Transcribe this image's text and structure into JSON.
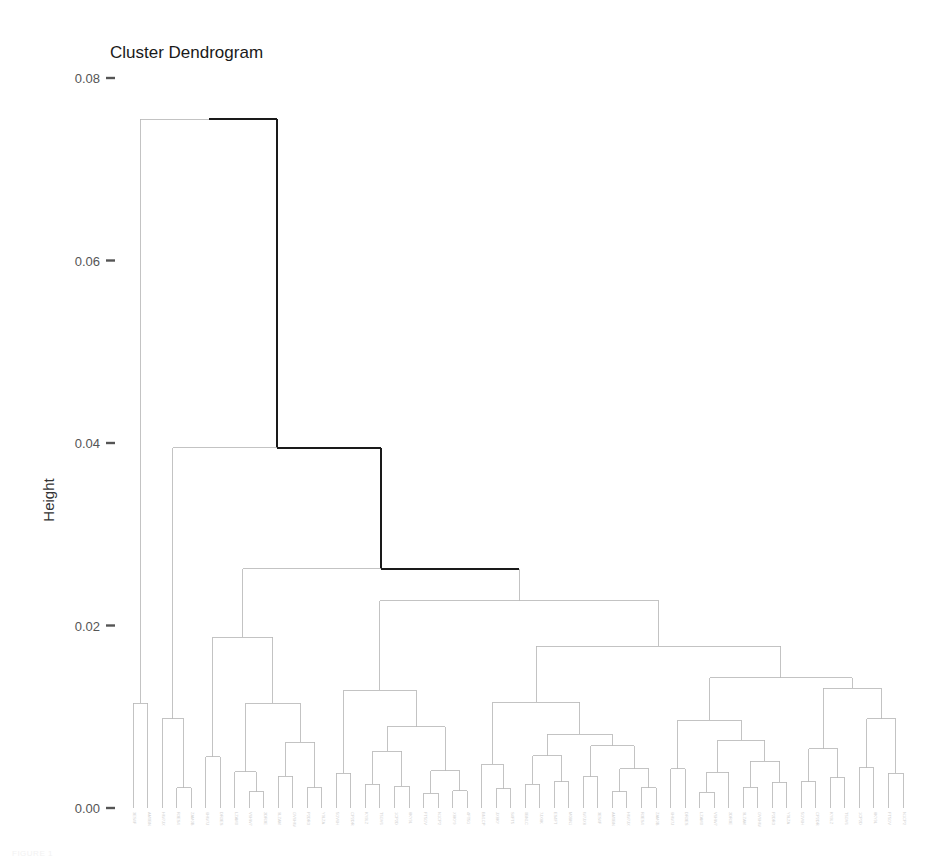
{
  "figure": {
    "title": "Cluster Dendrogram",
    "width": 930,
    "height": 867
  },
  "axis": {
    "y_title": "Height",
    "y_ticks": [
      "0.00",
      "0.02",
      "0.04",
      "0.06",
      "0.08"
    ],
    "y_tick_values": [
      0.0,
      0.02,
      0.04,
      0.06,
      0.08
    ],
    "x_title": "",
    "grid": false
  },
  "colors": {
    "background": "#ffffff",
    "branch_light": "#b9b9b9",
    "branch_highlight": "#1a1a1a",
    "tick_label": "#555555",
    "axis_title": "#333333",
    "title": "#1a1a1a",
    "leaf_label": "#d2d2d2"
  },
  "caption": {
    "ghost_text": "FIGURE 1"
  },
  "chart_data": {
    "type": "dendrogram",
    "title": "Cluster Dendrogram",
    "xlabel": "",
    "ylabel": "Height",
    "ylim": [
      0.0,
      0.08
    ],
    "grid": false,
    "legend": null,
    "n_leaves": 186,
    "leaf_labels_visible": false,
    "leaf_label_note": "leaf labels rendered rotated 90 degrees in very light gray, illegible at this resolution",
    "highlight_path_note": "the root merge and the two merges on its right spine (0.0755, 0.0395, 0.0262) are drawn in black; all other links are light gray",
    "merges": [
      {
        "id": "m_root",
        "height": 0.0755,
        "x_left": 148,
        "x_right": 245,
        "highlight": true
      },
      {
        "id": "m_b",
        "height": 0.0395,
        "x_left": 178,
        "x_right": 308,
        "highlight": true
      },
      {
        "id": "m_c",
        "height": 0.0262,
        "x_left": 205,
        "x_right": 412,
        "highlight": false
      },
      {
        "id": "m_d",
        "height": 0.0227,
        "x_left": 270,
        "x_right": 558,
        "highlight": false
      },
      {
        "id": "m_e",
        "height": 0.0177,
        "x_left": 389,
        "x_right": 730,
        "highlight": false
      }
    ],
    "tree": {
      "h": 0.0755,
      "c": [
        {
          "h": 0.0115,
          "c": [
            {
              "leaf": 0
            },
            {
              "leaf": 1
            }
          ]
        },
        {
          "h": 0.0395,
          "c": [
            {
              "h": 0.0098,
              "c": [
                {
                  "leaf": 2
                },
                {
                  "h": 0.0022,
                  "c": [
                    {
                      "leaf": 3
                    },
                    {
                      "leaf": 4
                    }
                  ]
                }
              ]
            },
            {
              "h": 0.0262,
              "c": [
                {
                  "h": 0.0187,
                  "c": [
                    {
                      "h": 0.0056,
                      "c": [
                        {
                          "leaf": 5
                        },
                        {
                          "leaf": 6
                        }
                      ]
                    },
                    {
                      "h": 0.0115,
                      "c": [
                        {
                          "h": 0.004,
                          "c": [
                            {
                              "leaf": 7
                            },
                            {
                              "h": 0.0018,
                              "c": [
                                {
                                  "leaf": 8
                                },
                                {
                                  "leaf": 9
                                }
                              ]
                            }
                          ]
                        },
                        {
                          "h": 0.0072,
                          "c": [
                            {
                              "h": 0.0035,
                              "c": [
                                {
                                  "leaf": 10
                                },
                                {
                                  "leaf": 11
                                }
                              ]
                            },
                            {
                              "h": 0.0022,
                              "c": [
                                {
                                  "leaf": 12
                                },
                                {
                                  "leaf": 13
                                }
                              ]
                            }
                          ]
                        }
                      ]
                    }
                  ]
                },
                {
                  "h": 0.0227,
                  "c": [
                    {
                      "h": 0.0129,
                      "c": [
                        {
                          "h": 0.0038,
                          "c": [
                            {
                              "leaf": 14
                            },
                            {
                              "leaf": 15
                            }
                          ]
                        },
                        {
                          "h": 0.0089,
                          "c": [
                            {
                              "h": 0.0062,
                              "c": [
                                {
                                  "h": 0.0026,
                                  "c": [
                                    {
                                      "leaf": 16
                                    },
                                    {
                                      "leaf": 17
                                    }
                                  ]
                                },
                                {
                                  "h": 0.0024,
                                  "c": [
                                    {
                                      "leaf": 18
                                    },
                                    {
                                      "leaf": 19
                                    }
                                  ]
                                }
                              ]
                            },
                            {
                              "h": 0.0041,
                              "c": [
                                {
                                  "h": 0.0016,
                                  "c": [
                                    {
                                      "leaf": 20
                                    },
                                    {
                                      "leaf": 21
                                    }
                                  ]
                                },
                                {
                                  "h": 0.0019,
                                  "c": [
                                    {
                                      "leaf": 22
                                    },
                                    {
                                      "leaf": 23
                                    }
                                  ]
                                }
                              ]
                            }
                          ]
                        }
                      ]
                    },
                    {
                      "h": 0.0177,
                      "c": [
                        {
                          "h": 0.0116,
                          "c": [
                            {
                              "h": 0.0048,
                              "c": [
                                {
                                  "leaf": 24
                                },
                                {
                                  "h": 0.0021,
                                  "c": [
                                    {
                                      "leaf": 25
                                    },
                                    {
                                      "leaf": 26
                                    }
                                  ]
                                }
                              ]
                            },
                            {
                              "h": 0.0081,
                              "c": [
                                {
                                  "h": 0.0057,
                                  "c": [
                                    {
                                      "h": 0.0026,
                                      "c": [
                                        {
                                          "leaf": 27
                                        },
                                        {
                                          "leaf": 28
                                        }
                                      ]
                                    },
                                    {
                                      "h": 0.0029,
                                      "c": [
                                        {
                                          "leaf": 29
                                        },
                                        {
                                          "leaf": 30
                                        }
                                      ]
                                    }
                                  ]
                                },
                                {
                                  "h": 0.0068,
                                  "c": [
                                    {
                                      "h": 0.0034,
                                      "c": [
                                        {
                                          "leaf": 31
                                        },
                                        {
                                          "leaf": 32
                                        }
                                      ]
                                    },
                                    {
                                      "h": 0.0043,
                                      "c": [
                                        {
                                          "h": 0.0018,
                                          "c": [
                                            {
                                              "leaf": 33
                                            },
                                            {
                                              "leaf": 34
                                            }
                                          ]
                                        },
                                        {
                                          "h": 0.0022,
                                          "c": [
                                            {
                                              "leaf": 35
                                            },
                                            {
                                              "leaf": 36
                                            }
                                          ]
                                        }
                                      ]
                                    }
                                  ]
                                }
                              ]
                            }
                          ]
                        },
                        {
                          "h": 0.0143,
                          "c": [
                            {
                              "h": 0.0096,
                              "c": [
                                {
                                  "h": 0.0043,
                                  "c": [
                                    {
                                      "leaf": 37
                                    },
                                    {
                                      "leaf": 38
                                    }
                                  ]
                                },
                                {
                                  "h": 0.0074,
                                  "c": [
                                    {
                                      "h": 0.0039,
                                      "c": [
                                        {
                                          "h": 0.0017,
                                          "c": [
                                            {
                                              "leaf": 39
                                            },
                                            {
                                              "leaf": 40
                                            }
                                          ]
                                        },
                                        {
                                          "leaf": 41
                                        }
                                      ]
                                    },
                                    {
                                      "h": 0.0051,
                                      "c": [
                                        {
                                          "h": 0.0023,
                                          "c": [
                                            {
                                              "leaf": 42
                                            },
                                            {
                                              "leaf": 43
                                            }
                                          ]
                                        },
                                        {
                                          "h": 0.0028,
                                          "c": [
                                            {
                                              "leaf": 44
                                            },
                                            {
                                              "leaf": 45
                                            }
                                          ]
                                        }
                                      ]
                                    }
                                  ]
                                }
                              ]
                            },
                            {
                              "h": 0.0131,
                              "c": [
                                {
                                  "h": 0.0065,
                                  "c": [
                                    {
                                      "h": 0.0029,
                                      "c": [
                                        {
                                          "leaf": 46
                                        },
                                        {
                                          "leaf": 47
                                        }
                                      ]
                                    },
                                    {
                                      "h": 0.0033,
                                      "c": [
                                        {
                                          "leaf": 48
                                        },
                                        {
                                          "leaf": 49
                                        }
                                      ]
                                    }
                                  ]
                                },
                                {
                                  "h": 0.0098,
                                  "c": [
                                    {
                                      "h": 0.0044,
                                      "c": [
                                        {
                                          "leaf": 50
                                        },
                                        {
                                          "leaf": 51
                                        }
                                      ]
                                    },
                                    {
                                      "h": 0.0038,
                                      "c": [
                                        {
                                          "leaf": 52
                                        },
                                        {
                                          "leaf": 53
                                        }
                                      ]
                                    }
                                  ]
                                }
                              ]
                            }
                          ]
                        }
                      ]
                    }
                  ]
                }
              ]
            }
          ]
        }
      ]
    }
  }
}
